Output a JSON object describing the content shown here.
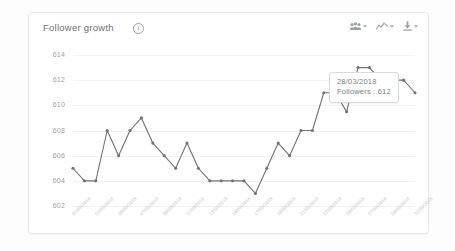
{
  "card": {
    "title": "Follower growth",
    "info_icon": "info-icon"
  },
  "toolbar": {
    "items": [
      {
        "icon": "people-group-icon",
        "label": "",
        "caret": "chevron-down-icon"
      },
      {
        "icon": "line-chart-icon",
        "label": "",
        "caret": "chevron-down-icon"
      },
      {
        "icon": "download-icon",
        "label": "",
        "caret": "chevron-down-icon"
      }
    ]
  },
  "tooltip": {
    "date": "28/03/2018",
    "value_line": "Followers : 612",
    "point_index": 27
  },
  "colors": {
    "line": "#6f7478",
    "marker": "#6f7478",
    "grid": "#f2f2f2",
    "axis_text": "#9da2a6",
    "tick_text": "#b9bdc0",
    "card_border": "#e8e8e8",
    "title_text": "#6e7276"
  },
  "chart_data": {
    "type": "line",
    "title": "Follower growth",
    "xlabel": "",
    "ylabel": "",
    "ylim": [
      602,
      614
    ],
    "yticks": [
      602,
      604,
      606,
      608,
      610,
      612,
      614
    ],
    "grid": true,
    "legend": false,
    "series": [
      {
        "name": "Followers",
        "values": [
          605,
          604,
          604,
          608,
          606,
          608,
          609,
          607,
          606,
          605,
          607,
          605,
          604,
          604,
          604,
          604,
          603,
          605,
          607,
          606,
          608,
          608,
          611,
          611,
          609.5,
          613,
          613,
          612,
          612,
          612,
          611
        ]
      }
    ],
    "x": [
      "01/03/2018",
      "02/03/2018",
      "03/03/2018",
      "04/03/2018",
      "05/03/2018",
      "06/03/2018",
      "07/03/2018",
      "08/03/2018",
      "09/03/2018",
      "10/03/2018",
      "11/03/2018",
      "12/03/2018",
      "13/03/2018",
      "14/03/2018",
      "15/03/2018",
      "16/03/2018",
      "17/03/2018",
      "18/03/2018",
      "19/03/2018",
      "20/03/2018",
      "21/03/2018",
      "22/03/2018",
      "23/03/2018",
      "24/03/2018",
      "25/03/2018",
      "26/03/2018",
      "27/03/2018",
      "28/03/2018",
      "29/03/2018",
      "30/03/2018",
      "31/03/2018"
    ],
    "xticklabels": [
      "01/03/2018",
      "03/03/2018",
      "05/03/2018",
      "07/03/2018",
      "09/03/2018",
      "11/03/2018",
      "13/03/2018",
      "15/03/2018",
      "17/03/2018",
      "19/03/2018",
      "21/03/2018",
      "23/03/2018",
      "25/03/2018",
      "27/03/2018",
      "29/03/2018",
      "31/03/2018"
    ],
    "annotation": {
      "date": "28/03/2018",
      "label": "Followers : 612",
      "value": 612
    }
  }
}
